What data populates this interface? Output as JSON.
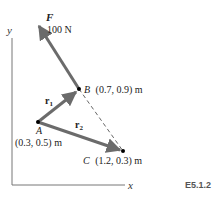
{
  "figure_id": "E5.1.2",
  "axes": {
    "x_label": "x",
    "y_label": "y"
  },
  "force": {
    "symbol": "F",
    "magnitude": "100 N"
  },
  "points": {
    "A": {
      "name": "A",
      "coords": "(0.3, 0.5) m"
    },
    "B": {
      "name": "B",
      "coords": "(0.7, 0.9) m"
    },
    "C": {
      "name": "C",
      "coords": "(1.2, 0.3) m"
    }
  },
  "vectors": {
    "r1": {
      "base": "r",
      "sub": "1"
    },
    "r2": {
      "base": "r",
      "sub": "2"
    }
  },
  "colors": {
    "vector": "#6b6b6b",
    "axis": "#777777",
    "text": "#222222",
    "point": "#000000"
  }
}
